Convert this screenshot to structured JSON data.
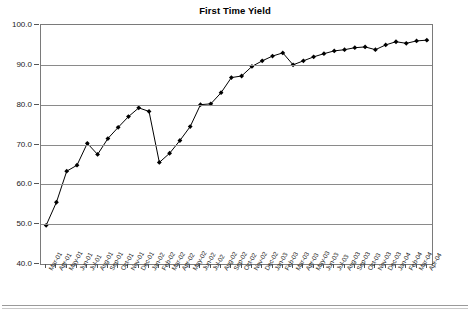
{
  "chart_data": {
    "type": "line",
    "title": "First Time Yield",
    "xlabel": "",
    "ylabel": "",
    "ylim": [
      40.0,
      100.0
    ],
    "yticks": [
      "100.0",
      "90.0",
      "80.0",
      "70.0",
      "60.0",
      "50.0",
      "40.0"
    ],
    "ytick_values": [
      100.0,
      90.0,
      80.0,
      70.0,
      60.0,
      50.0,
      40.0
    ],
    "grid": true,
    "legend": "none",
    "marker": "diamond",
    "line_color": "#000000",
    "marker_color": "#000000",
    "grid_color": "#8a8a8a",
    "categories": [
      "Mar-01",
      "Apr-01",
      "May-01",
      "Jun-01",
      "Jul-01",
      "Aug-01",
      "Sep-01",
      "Oct-01",
      "Nov-01",
      "Dec-01",
      "Jan-02",
      "Feb-02",
      "Mar-02",
      "Apr-02",
      "May-02",
      "Jun-02",
      "Jul-02",
      "Aug-02",
      "Sep-02",
      "Oct-02",
      "Nov-02",
      "Dec-02",
      "Jan-03",
      "Feb-03",
      "Mar-03",
      "Apr-03",
      "May-03",
      "Jun-03",
      "Jul-03",
      "Aug-03",
      "Sep-03",
      "Oct-03",
      "Nov-03",
      "Dec-03",
      "Jan-04",
      "Feb-04",
      "Mar-04",
      "Apr-04"
    ],
    "values": [
      49.7,
      55.5,
      63.3,
      64.8,
      70.3,
      67.5,
      71.5,
      74.3,
      77.0,
      79.2,
      78.3,
      65.5,
      67.8,
      71.0,
      74.5,
      80.0,
      80.2,
      83.0,
      86.8,
      87.2,
      89.6,
      91.0,
      92.2,
      93.0,
      90.0,
      91.0,
      92.0,
      92.8,
      93.5,
      93.8,
      94.3,
      94.5,
      93.8,
      95.0,
      95.8,
      95.4,
      96.0,
      96.2
    ]
  }
}
